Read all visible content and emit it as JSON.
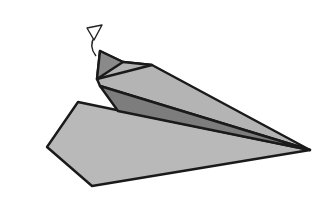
{
  "figure": {
    "background": "#ffffff",
    "colors": {
      "outline": "#1a1a1a",
      "light_gray": "#b9b9b9",
      "mid_gray": "#a6a6a6",
      "dark_gray": "#7d7d7d",
      "tail_gray": "#8a8a8a"
    },
    "parts": [
      {
        "name": "lower-wing",
        "points": "78,102 47,147 92,186 310,150"
      },
      {
        "name": "upper-body",
        "points": "97,79 123,62 152,65 310,150 100,86"
      },
      {
        "name": "inner-fold",
        "points": "100,86 310,150 118,111"
      },
      {
        "name": "tail-flap",
        "points": "100,51 123,62 97,79"
      },
      {
        "name": "tail-top",
        "points": "100,51 123,62 152,65 97,79"
      }
    ],
    "arrow": {
      "head": "87,28 102,25 94,40",
      "shaft": "M 96 56 Q 88 46 95 36"
    }
  }
}
